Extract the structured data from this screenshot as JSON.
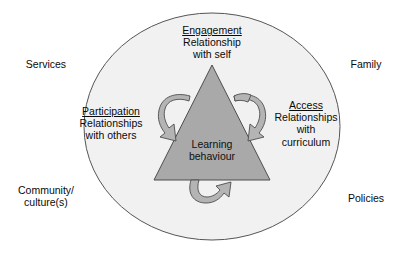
{
  "diagram": {
    "type": "concept-diagram",
    "core": {
      "line1": "Learning",
      "line2": "behaviour"
    },
    "nodes": [
      {
        "id": "engagement",
        "heading": "Engagement",
        "line1": "Relationship",
        "line2": "with self",
        "line3": ""
      },
      {
        "id": "participation",
        "heading": "Participation",
        "line1": "Relationships",
        "line2": "with others",
        "line3": ""
      },
      {
        "id": "access",
        "heading": "Access",
        "line1": "Relationships",
        "line2": "with",
        "line3": "curriculum"
      }
    ],
    "context_labels": [
      {
        "id": "services",
        "line1": "Services",
        "line2": ""
      },
      {
        "id": "family",
        "line1": "Family",
        "line2": ""
      },
      {
        "id": "community",
        "line1": "Community/",
        "line2": "culture(s)"
      },
      {
        "id": "policies",
        "line1": "Policies",
        "line2": ""
      }
    ],
    "arrows": [
      {
        "id": "arrow-left",
        "direction": "counterclockwise"
      },
      {
        "id": "arrow-right",
        "direction": "counterclockwise"
      },
      {
        "id": "arrow-bottom",
        "direction": "counterclockwise"
      }
    ],
    "colors": {
      "page_background": "#ffffff",
      "ellipse_fill": "#f1f1f1",
      "ellipse_stroke": "#555555",
      "triangle_fill": "#a9a9a9",
      "triangle_stroke": "#4d4d4d",
      "arrow_fill": "#b4b4b4",
      "arrow_stroke": "#4d4d4d",
      "text": "#0a0a0a"
    }
  }
}
